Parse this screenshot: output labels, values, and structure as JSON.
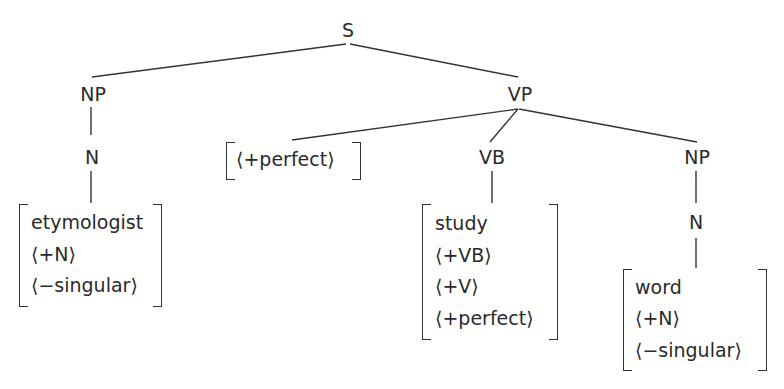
{
  "diagram": {
    "type": "syntax-tree",
    "root": {
      "label": "S"
    },
    "nodes": {
      "s": "S",
      "np_subject": "NP",
      "n_subject": "N",
      "vp": "VP",
      "vb": "VB",
      "np_object": "NP",
      "n_object": "N"
    },
    "features": {
      "aspect": [
        "⟨+perfect⟩"
      ],
      "subject_noun": [
        "etymologist",
        "⟨+N⟩",
        "⟨−singular⟩"
      ],
      "verb": [
        "study",
        "⟨+VB⟩",
        "⟨+V⟩",
        "⟨+perfect⟩"
      ],
      "object_noun": [
        "word",
        "⟨+N⟩",
        "⟨−singular⟩"
      ]
    },
    "edges": [
      [
        "S",
        "NP"
      ],
      [
        "S",
        "VP"
      ],
      [
        "NP",
        "N"
      ],
      [
        "N",
        "etymologist"
      ],
      [
        "VP",
        "⟨+perfect⟩"
      ],
      [
        "VP",
        "VB"
      ],
      [
        "VP",
        "NP"
      ],
      [
        "VB",
        "study"
      ],
      [
        "NP",
        "N"
      ],
      [
        "N",
        "word"
      ]
    ],
    "line_color": "#333333"
  }
}
